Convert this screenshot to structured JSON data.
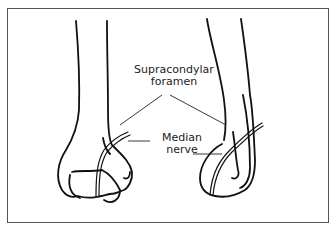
{
  "figure": {
    "labels": {
      "foramen_line1": "Supracondylar",
      "foramen_line2": "foramen",
      "nerve_line1": "Median",
      "nerve_line2": "nerve"
    },
    "colors": {
      "stroke": "#111111",
      "frame": "#555555",
      "background": "#ffffff"
    }
  }
}
